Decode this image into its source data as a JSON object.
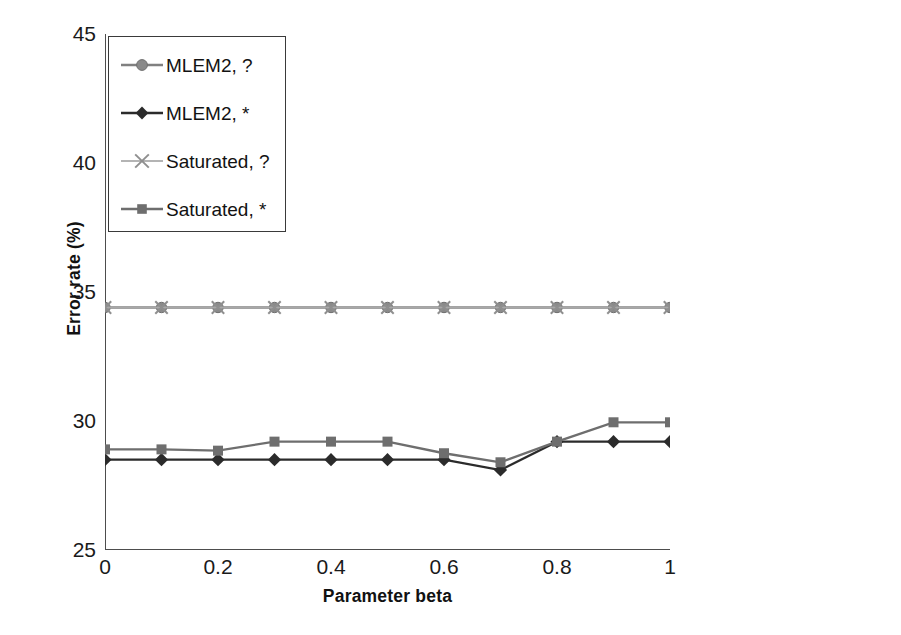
{
  "chart_data": {
    "type": "line",
    "title": "",
    "xlabel": "Parameter beta",
    "ylabel": "Error rate (%)",
    "xlim": [
      0,
      1
    ],
    "ylim": [
      25,
      45
    ],
    "x": [
      0,
      0.1,
      0.2,
      0.3,
      0.4,
      0.5,
      0.6,
      0.7,
      0.8,
      0.9,
      1
    ],
    "xticks": [
      "0",
      "0.2",
      "0.4",
      "0.6",
      "0.8",
      "1"
    ],
    "xtick_values": [
      0,
      0.2,
      0.4,
      0.6,
      0.8,
      1
    ],
    "yticks": [
      "45",
      "40",
      "35",
      "30",
      "25"
    ],
    "ytick_values": [
      45,
      40,
      35,
      30,
      25
    ],
    "grid": "horizontal",
    "legend_position": "top-left inside plot",
    "series": [
      {
        "name": "MLEM2, ?",
        "marker": "circle",
        "color": "#808080",
        "values": [
          34.4,
          34.4,
          34.4,
          34.4,
          34.4,
          34.4,
          34.4,
          34.4,
          34.4,
          34.4,
          34.4
        ]
      },
      {
        "name": "MLEM2, *",
        "marker": "diamond",
        "color": "#2b2b2b",
        "values": [
          28.5,
          28.5,
          28.5,
          28.5,
          28.5,
          28.5,
          28.5,
          28.1,
          29.2,
          29.2,
          29.2
        ]
      },
      {
        "name": "Saturated, ?",
        "marker": "cross",
        "color": "#a8a8a8",
        "values": [
          34.4,
          34.4,
          34.4,
          34.4,
          34.4,
          34.4,
          34.4,
          34.4,
          34.4,
          34.4,
          34.4
        ]
      },
      {
        "name": "Saturated, *",
        "marker": "square",
        "color": "#6e6e6e",
        "values": [
          28.9,
          28.9,
          28.85,
          29.2,
          29.2,
          29.2,
          28.75,
          28.4,
          29.2,
          29.95,
          29.95
        ]
      }
    ]
  },
  "axes": {
    "y_title": "Error rate (%)",
    "x_title": "Parameter beta",
    "y_tick_labels": [
      "45",
      "40",
      "35",
      "30",
      "25"
    ],
    "x_tick_labels": [
      "0",
      "0.2",
      "0.4",
      "0.6",
      "0.8",
      "1"
    ]
  },
  "legend": {
    "items": [
      {
        "label": "MLEM2, ?",
        "marker": "circle-marker-icon",
        "color": "#808080"
      },
      {
        "label": "MLEM2, *",
        "marker": "diamond-marker-icon",
        "color": "#2b2b2b"
      },
      {
        "label": "Saturated, ?",
        "marker": "cross-marker-icon",
        "color": "#a8a8a8"
      },
      {
        "label": "Saturated, *",
        "marker": "square-marker-icon",
        "color": "#6e6e6e"
      }
    ]
  },
  "colors": {
    "axis": "#4d4d4d",
    "grid": "#b9b9b9",
    "background": "#ffffff",
    "legend_border": "#3a3a3a"
  }
}
